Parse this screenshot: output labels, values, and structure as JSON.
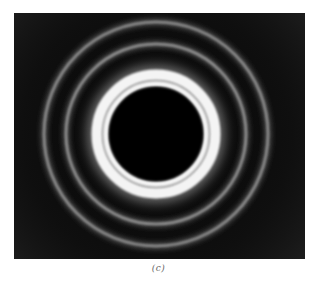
{
  "figure": {
    "caption": "(c)",
    "colors": {
      "background": "#0b0b0b",
      "bright_ring": "#f2f2f2",
      "outer_ring": "#8a8a8a",
      "center_disc": "#020202"
    },
    "rings": [
      {
        "name": "center-disc",
        "radius": 47
      },
      {
        "name": "bright-ring-inner",
        "radius": 52
      },
      {
        "name": "bright-ring-outer",
        "radius": 60
      },
      {
        "name": "second-ring",
        "radius": 90
      },
      {
        "name": "outer-ring",
        "radius": 112
      }
    ]
  }
}
